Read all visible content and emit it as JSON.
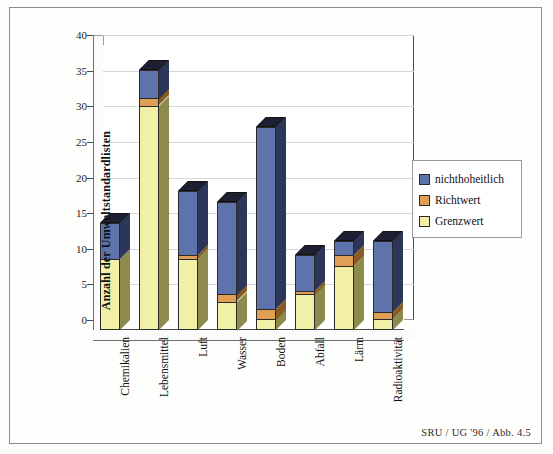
{
  "figure": {
    "footer_note": "SRU / UG '96 / Abb. 4.5"
  },
  "legend": {
    "position": "right",
    "items": [
      {
        "label": "nichthoheitlich",
        "color": "#5e73ab"
      },
      {
        "label": "Richtwert",
        "color": "#dfa055"
      },
      {
        "label": "Grenzwert",
        "color": "#f2f0a6"
      }
    ]
  },
  "axis": {
    "y_title": "Anzahl der Umweltstandardlisten",
    "y_ticks": [
      "0",
      "5",
      "10",
      "15",
      "20",
      "25",
      "30",
      "35",
      "40"
    ]
  },
  "chart_data": {
    "type": "bar",
    "stacked": true,
    "three_d": true,
    "title": "",
    "xlabel": "",
    "ylabel": "Anzahl der Umweltstandardlisten",
    "ylim": [
      0,
      40
    ],
    "ytick_step": 5,
    "grid": true,
    "legend_position": "right",
    "categories": [
      "Chemikalien",
      "Lebensmittel",
      "Luft",
      "Wasser",
      "Boden",
      "Abfall",
      "Lärm",
      "Radioaktivität"
    ],
    "series": [
      {
        "name": "Grenzwert",
        "color": "#f2f0a6",
        "values": [
          10,
          31.5,
          10,
          4,
          1.5,
          5,
          9,
          1.5
        ]
      },
      {
        "name": "Richtwert",
        "color": "#dfa055",
        "values": [
          0,
          1,
          0.5,
          1,
          1.5,
          0.5,
          1.5,
          1
        ]
      },
      {
        "name": "nichthoheitlich",
        "color": "#5e73ab",
        "values": [
          5,
          4,
          9,
          13,
          25.5,
          5,
          2,
          10
        ]
      }
    ],
    "totals": [
      15,
      36.5,
      19.5,
      18,
      28.5,
      10.5,
      12.5,
      12.5
    ],
    "annotations": [
      "SRU / UG '96 / Abb. 4.5"
    ]
  }
}
